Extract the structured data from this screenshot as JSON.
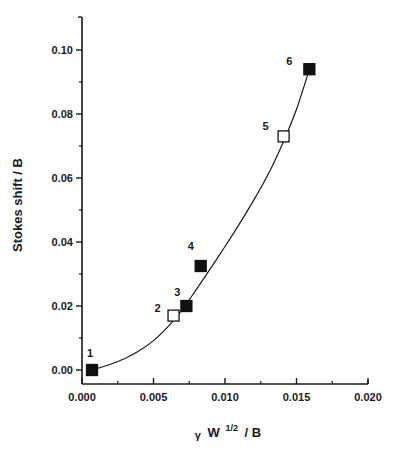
{
  "chart_data": {
    "type": "scatter",
    "title": "",
    "xlabel": "γ W^1/2 / B",
    "xlabel_parts": {
      "gamma": "γ",
      "w": "W",
      "sup": "1/2",
      "rest": "/ B"
    },
    "ylabel": "Stokes shift / B",
    "xlim": [
      0.0,
      0.02
    ],
    "ylim": [
      -0.004,
      0.11
    ],
    "x_ticks": [
      "0.000",
      "0.005",
      "0.010",
      "0.015",
      "0.020"
    ],
    "x_tick_values": [
      0.0,
      0.005,
      0.01,
      0.015,
      0.02
    ],
    "y_ticks": [
      "0.00",
      "0.02",
      "0.04",
      "0.06",
      "0.08",
      "0.10"
    ],
    "y_tick_values": [
      0.0,
      0.02,
      0.04,
      0.06,
      0.08,
      0.1
    ],
    "grid": false,
    "legend": null,
    "series": [
      {
        "name": "data points",
        "points": [
          {
            "label": "1",
            "x": 0.0007,
            "y": 0.0,
            "marker": "filled-square"
          },
          {
            "label": "2",
            "x": 0.0064,
            "y": 0.017,
            "marker": "open-square"
          },
          {
            "label": "3",
            "x": 0.0073,
            "y": 0.02,
            "marker": "filled-square"
          },
          {
            "label": "4",
            "x": 0.0083,
            "y": 0.0325,
            "marker": "filled-square"
          },
          {
            "label": "5",
            "x": 0.0141,
            "y": 0.073,
            "marker": "open-square"
          },
          {
            "label": "6",
            "x": 0.0159,
            "y": 0.094,
            "marker": "filled-square"
          }
        ]
      },
      {
        "name": "fit curve",
        "type": "line",
        "x": [
          0.0007,
          0.002,
          0.003,
          0.004,
          0.005,
          0.006,
          0.007,
          0.008,
          0.009,
          0.01,
          0.011,
          0.012,
          0.013,
          0.014,
          0.015,
          0.0159
        ],
        "y": [
          0.0,
          0.0018,
          0.0036,
          0.006,
          0.0092,
          0.0135,
          0.0188,
          0.0252,
          0.0318,
          0.0386,
          0.0456,
          0.053,
          0.061,
          0.0705,
          0.0815,
          0.094
        ]
      }
    ]
  }
}
